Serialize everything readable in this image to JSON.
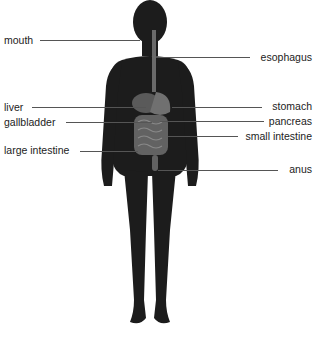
{
  "diagram": {
    "labels_left": [
      {
        "id": "mouth",
        "text": "mouth",
        "y": 40
      },
      {
        "id": "liver",
        "text": "liver",
        "y": 107
      },
      {
        "id": "gallbladder",
        "text": "gallbladder",
        "y": 122
      },
      {
        "id": "large-intestine",
        "text": "large intestine",
        "y": 150
      }
    ],
    "labels_right": [
      {
        "id": "esophagus",
        "text": "esophagus",
        "y": 57
      },
      {
        "id": "stomach",
        "text": "stomach",
        "y": 106
      },
      {
        "id": "pancreas",
        "text": "pancreas",
        "y": 121
      },
      {
        "id": "small-intestine",
        "text": "small intestine",
        "y": 136
      },
      {
        "id": "anus",
        "text": "anus",
        "y": 169
      }
    ],
    "colors": {
      "silhouette": "#1c1c1c",
      "organs": "#6a6a6a",
      "leader": "#555555",
      "text": "#222222"
    }
  }
}
